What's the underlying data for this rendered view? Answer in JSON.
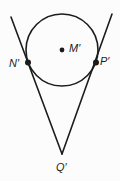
{
  "figure": {
    "background": "#fcfcfc",
    "ink": "#1c1c1c",
    "labels": {
      "center": "M′",
      "left_tangent": "N′",
      "right_tangent": "P′",
      "external": "Q′"
    },
    "geometry": {
      "circle": {
        "cx": 62,
        "cy": 50,
        "r": 36
      },
      "center_dot": {
        "cx": 62,
        "cy": 50,
        "r": 2.4
      },
      "left_tangent_dot": {
        "cx": 28,
        "cy": 62.5,
        "r": 3
      },
      "right_tangent_dot": {
        "cx": 96,
        "cy": 62.5,
        "r": 3
      },
      "left_line": {
        "x1": 11,
        "y1": 17,
        "x2": 62,
        "y2": 154
      },
      "right_line": {
        "x1": 112,
        "y1": 14,
        "x2": 62,
        "y2": 154
      },
      "label_pos": {
        "center": {
          "x": 69,
          "y": 52
        },
        "left_tangent": {
          "x": 9,
          "y": 67
        },
        "right_tangent": {
          "x": 100,
          "y": 65
        },
        "external": {
          "x": 56,
          "y": 171
        }
      }
    }
  }
}
